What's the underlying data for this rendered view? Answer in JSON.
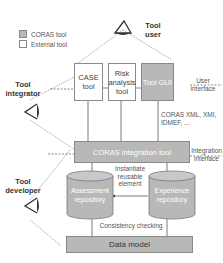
{
  "legend": {
    "items": [
      {
        "label": "CORAS tool",
        "color": "#b8b8b8"
      },
      {
        "label": "External tool",
        "color": "#ffffff"
      }
    ]
  },
  "actors": {
    "tool_user": "Tool user",
    "tool_integrator": "Tool integrator",
    "tool_developer": "Tool developer"
  },
  "boxes": {
    "case_tool": "CASE tool",
    "risk_analysis_tool": "Risk analysis tool",
    "tool_gui": "Tool GUI",
    "integration_tool": "CORAS integration tool",
    "assessment_repository": "Assessment repository",
    "experience_repository": "Experience repository",
    "data_model": "Data model"
  },
  "labels": {
    "user_interface": "User interface",
    "formats": "CORAS XML, XMI, IDMEF, ...",
    "integration_interface": "Integration interface",
    "instantiate": "Instantiate reusable element",
    "consistency": "Consistency checking"
  },
  "colors": {
    "coras_fill": "#b8b8b8",
    "border": "#8a8a8a"
  }
}
